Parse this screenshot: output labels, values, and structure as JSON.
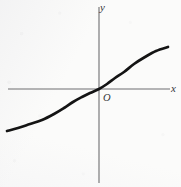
{
  "figure": {
    "name": "cube-root-curve-diagram",
    "width": 181,
    "height": 187,
    "background_color": "#fbfbfa",
    "ink_color": "#141414",
    "axis_color": "#6e6e70"
  },
  "labels": {
    "x_axis": "x",
    "y_axis": "y",
    "origin": "O"
  },
  "chart_data": {
    "type": "line",
    "title": "",
    "subtitle": "",
    "xlabel": "x",
    "ylabel": "y",
    "grid": false,
    "legend": false,
    "legend_position": "none",
    "axes": {
      "origin_px": [
        99,
        89
      ],
      "x_axis_px": {
        "y": 89,
        "x_start": 8,
        "x_end": 170
      },
      "y_axis_px": {
        "x": 99,
        "y_start": 7,
        "y_end": 183
      },
      "arrowheads": false,
      "ticks": [],
      "tick_labels": []
    },
    "xlim": [
      -2.4,
      1.8
    ],
    "ylim": [
      -2.2,
      2.2
    ],
    "series": [
      {
        "name": "odd increasing S-curve (cube-root type)",
        "stroke_color": "#141414",
        "stroke_width_px": 2.7,
        "points_px": [
          [
            7,
            131
          ],
          [
            18,
            128
          ],
          [
            30,
            124
          ],
          [
            42,
            120
          ],
          [
            54,
            114
          ],
          [
            64,
            108
          ],
          [
            73,
            102
          ],
          [
            82,
            97
          ],
          [
            90,
            93
          ],
          [
            99,
            89
          ],
          [
            107,
            84
          ],
          [
            115,
            78
          ],
          [
            124,
            72
          ],
          [
            134,
            64
          ],
          [
            145,
            57
          ],
          [
            156,
            51
          ],
          [
            168,
            47
          ]
        ],
        "x": [
          -2.4,
          -2.1,
          -1.8,
          -1.5,
          -1.2,
          -0.9,
          -0.6,
          -0.3,
          0.0,
          0.3,
          0.6,
          0.9,
          1.2,
          1.5,
          1.8
        ],
        "values": [
          -1.34,
          -1.28,
          -1.22,
          -1.14,
          -1.06,
          -0.96,
          -0.84,
          -0.66,
          0.0,
          0.66,
          0.84,
          0.96,
          1.06,
          1.14,
          1.22
        ]
      }
    ],
    "annotations": [
      {
        "text": "y",
        "px": [
          100,
          4
        ],
        "style": "italic",
        "anchor": "start"
      },
      {
        "text": "x",
        "px": [
          172,
          88
        ],
        "style": "italic",
        "anchor": "start"
      },
      {
        "text": "O",
        "px": [
          104,
          98
        ],
        "style": "italic",
        "anchor": "start"
      }
    ]
  }
}
